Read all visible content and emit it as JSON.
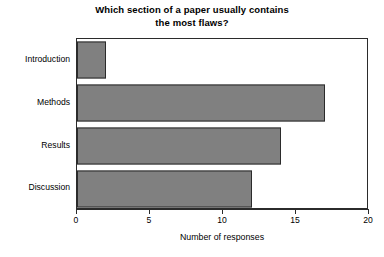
{
  "chart_data": {
    "type": "bar",
    "orientation": "horizontal",
    "title": "Which section of a paper usually contains the most flaws?",
    "title_lines": [
      "Which section of a paper usually contains",
      "the most flaws?"
    ],
    "categories": [
      "Introduction",
      "Methods",
      "Results",
      "Discussion"
    ],
    "values": [
      2,
      17,
      14,
      12
    ],
    "xlabel": "Number of responses",
    "ylabel": "",
    "xlim": [
      0,
      20
    ],
    "xticks": [
      0,
      5,
      10,
      15,
      20
    ],
    "xtick_labels": [
      "0",
      "5",
      "10",
      "15",
      "20"
    ],
    "grid": false,
    "legend": false,
    "bar_color": "#808080",
    "bar_edge_color": "#2b2b2b",
    "axis_color": "#2b2b2b",
    "background_color": "#ffffff"
  }
}
